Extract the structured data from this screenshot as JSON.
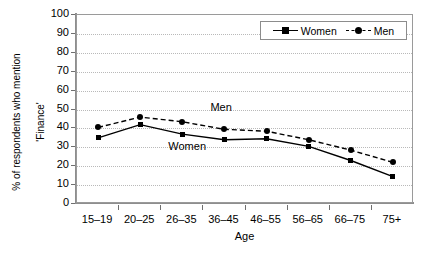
{
  "chart_data": {
    "type": "line",
    "title": "",
    "xlabel": "Age",
    "ylabel": "% of respondents who mention\n'Finance'",
    "categories": [
      "15–19",
      "20–25",
      "26–35",
      "36–45",
      "46–55",
      "56–65",
      "66–75",
      "75+"
    ],
    "yticks": [
      0,
      10,
      20,
      30,
      40,
      50,
      60,
      70,
      80,
      90,
      100
    ],
    "ylim": [
      0,
      100
    ],
    "grid": "horizontal-dotted",
    "legend_position": "top-right",
    "series": [
      {
        "name": "Women",
        "marker": "square",
        "line": "solid",
        "color": "#000000",
        "values": [
          35,
          42,
          37,
          34,
          34.5,
          30.5,
          23,
          14.5
        ]
      },
      {
        "name": "Men",
        "marker": "circle",
        "line": "dashed",
        "color": "#000000",
        "values": [
          40.5,
          46,
          43.5,
          39.5,
          38.5,
          34,
          28.5,
          22
        ]
      }
    ],
    "annotations": [
      {
        "text": "Men",
        "x_category": "36–45",
        "y_value": 51
      },
      {
        "text": "Women",
        "x_category": "26–35",
        "y_value": 30
      }
    ]
  },
  "legend": {
    "entries": [
      {
        "label": "Women"
      },
      {
        "label": "Men"
      }
    ]
  },
  "axis": {
    "x_title": "Age",
    "y_title_line1": "% of respondents who mention",
    "y_title_line2": "'Finance'"
  }
}
